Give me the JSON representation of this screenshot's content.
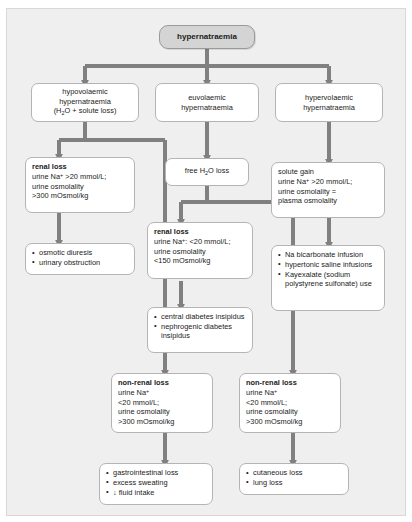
{
  "diagram": {
    "title_node": "hypernatraemia",
    "branches": {
      "hypovolaemic": {
        "line1": "hypovolaemic",
        "line2": "hypernatraemia",
        "line3_pre": "(H",
        "line3_sub": "2",
        "line3_post": "O + solute loss)"
      },
      "euvolaemic": {
        "line1": "euvolaemic",
        "line2": "hypernatraemia"
      },
      "hypervolaemic": {
        "line1": "hypervolaemic",
        "line2": "hypernatraemia"
      }
    },
    "free_water": {
      "pre": "free H",
      "sub": "2",
      "post": "O loss"
    },
    "renal_loss_left": {
      "title": "renal loss",
      "l1_pre": "urine Na",
      "l1_sup": "+",
      "l1_post": " >20 mmol/L;",
      "l2": "urine osmolality",
      "l3": ">300 mOsmol/kg"
    },
    "renal_loss_mid": {
      "title": "renal loss",
      "l1_pre": "urine Na",
      "l1_sup": "+",
      "l1_post": ": <20 mmol/L;",
      "l2": "urine osmolality",
      "l3": "<150 mOsmol/kg"
    },
    "solute_gain": {
      "title": "solute gain",
      "l1_pre": "urine Na",
      "l1_sup": "+",
      "l1_post": " >20 mmol/L;",
      "l2": "urine osmolality =",
      "l3": "plasma osmolality"
    },
    "non_renal_left": {
      "title": "non-renal loss",
      "l1_pre": "urine Na",
      "l1_sup": "+",
      "l2": "<20 mmol/L;",
      "l3": "urine osmolality",
      "l4": ">300 mOsmol/kg"
    },
    "non_renal_right": {
      "title": "non-renal loss",
      "l1_pre": "urine Na",
      "l1_sup": "+",
      "l2": "<20 mmol/L;",
      "l3": "urine osmolality",
      "l4": ">300 mOsmol/kg"
    },
    "causes_renal_left": [
      "osmotic diuresis",
      "urinary obstruction"
    ],
    "causes_renal_mid": [
      "central diabetes insipidus",
      "nephrogenic diabetes insipidus"
    ],
    "causes_solute_gain": [
      "Na bicarbonate infusion",
      "hypertonic saline infusions",
      "Kayexalate (sodium polystyrene sulfonate) use"
    ],
    "causes_non_renal_left": [
      "gastrointestinal loss",
      "excess sweating",
      "↓ fluid intake"
    ],
    "causes_non_renal_right": [
      "cutaneous loss",
      "lung loss"
    ]
  },
  "colors": {
    "canvas": "#efefef",
    "box_fill": "#ffffff",
    "box_border": "#b4b4b4",
    "top_fill": "#d4d4d4",
    "connector": "#808080",
    "text": "#1a1a1a"
  }
}
